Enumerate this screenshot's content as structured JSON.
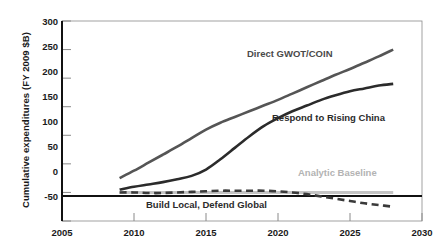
{
  "chart_data": {
    "type": "line",
    "title": "",
    "xlabel": "",
    "ylabel": "Cumulative expenditures (FY 2009 $B)",
    "xlim": [
      2005,
      2030
    ],
    "ylim": [
      -50,
      300
    ],
    "xticks": [
      2005,
      2010,
      2015,
      2020,
      2025,
      2030
    ],
    "yticks": [
      -50,
      0,
      50,
      100,
      150,
      200,
      250,
      300
    ],
    "xtick_labels": [
      "2005",
      "2010",
      "2015",
      "2020",
      "2025",
      "2030"
    ],
    "ytick_labels": [
      "-50",
      "0",
      "50",
      "100",
      "150",
      "200",
      "250",
      "300"
    ],
    "grid": false,
    "legend_position": "inline-annotations",
    "series": [
      {
        "name": "Direct GWOT/COIN",
        "color": "#555555",
        "style": "solid",
        "label_text": "Direct GWOT/COIN",
        "x": [
          2009,
          2010,
          2011,
          2012,
          2013,
          2014,
          2015,
          2016,
          2017,
          2018,
          2019,
          2020,
          2021,
          2022,
          2023,
          2024,
          2025,
          2026,
          2027,
          2028
        ],
        "y": [
          25,
          38,
          52,
          66,
          80,
          95,
          110,
          122,
          132,
          142,
          152,
          162,
          173,
          184,
          195,
          206,
          216,
          227,
          238,
          250
        ]
      },
      {
        "name": "Respond to Rising China",
        "color": "#2b2b2b",
        "style": "solid",
        "label_text": "Respond to Rising China",
        "x": [
          2009,
          2010,
          2011,
          2012,
          2013,
          2014,
          2015,
          2016,
          2017,
          2018,
          2019,
          2020,
          2021,
          2022,
          2023,
          2024,
          2025,
          2026,
          2027,
          2028
        ],
        "y": [
          5,
          10,
          14,
          18,
          23,
          29,
          40,
          58,
          78,
          98,
          116,
          130,
          142,
          152,
          162,
          170,
          177,
          182,
          187,
          190
        ]
      },
      {
        "name": "Analytic Baseline",
        "color": "#c4c4c4",
        "style": "solid",
        "label_text": "Analytic Baseline",
        "x": [
          2009,
          2028
        ],
        "y": [
          0,
          0
        ]
      },
      {
        "name": "Build Local, Defend Global",
        "color": "#3a3a3a",
        "style": "dashed",
        "label_text": "Build Local, Defend Global",
        "x": [
          2009,
          2010,
          2011,
          2012,
          2013,
          2014,
          2015,
          2016,
          2017,
          2018,
          2019,
          2020,
          2021,
          2022,
          2023,
          2024,
          2025,
          2026,
          2027,
          2028
        ],
        "y": [
          0,
          0,
          -1,
          -1,
          0,
          1,
          2,
          3,
          3,
          3,
          3,
          2,
          0,
          -3,
          -7,
          -11,
          -15,
          -19,
          -22,
          -25
        ]
      }
    ]
  },
  "axis": {
    "y_title": "Cumulative expenditures (FY 2009 $B)"
  }
}
